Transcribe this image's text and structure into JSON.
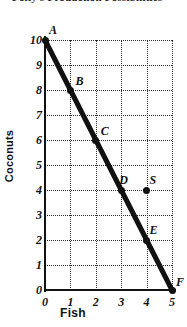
{
  "chart_data": {
    "type": "line",
    "title": "Polly's Production Possibilities",
    "xlabel": "Fish",
    "ylabel": "Coconuts",
    "xlim": [
      0,
      5
    ],
    "ylim": [
      0,
      10
    ],
    "x_ticks": [
      "0",
      "1",
      "2",
      "3",
      "4",
      "5"
    ],
    "y_ticks": [
      "0",
      "1",
      "2",
      "3",
      "4",
      "5",
      "6",
      "7",
      "8",
      "9",
      "10"
    ],
    "grid": "dotted",
    "legend": "none",
    "series": [
      {
        "name": "Production possibilities frontier",
        "type": "line",
        "x": [
          0,
          1,
          2,
          3,
          4,
          5
        ],
        "values": [
          10,
          8,
          6,
          4,
          2,
          0
        ],
        "slope": -2,
        "color": "#111111"
      }
    ],
    "annotations": [
      {
        "label": "A",
        "x": 0,
        "y": 10,
        "on_frontier": true,
        "marker": "dot"
      },
      {
        "label": "B",
        "x": 1,
        "y": 8,
        "on_frontier": true,
        "marker": "dot"
      },
      {
        "label": "C",
        "x": 2,
        "y": 6,
        "on_frontier": true,
        "marker": "dot"
      },
      {
        "label": "D",
        "x": 3,
        "y": 4,
        "on_frontier": true,
        "marker": "dot"
      },
      {
        "label": "E",
        "x": 4,
        "y": 2,
        "on_frontier": true,
        "marker": "dot"
      },
      {
        "label": "F",
        "x": 5,
        "y": 0,
        "on_frontier": true,
        "marker": "dot"
      },
      {
        "label": "S",
        "x": 4,
        "y": 4,
        "on_frontier": false,
        "marker": "dot"
      }
    ]
  },
  "axes": {
    "x_title": "Fish",
    "y_title": "Coconuts"
  },
  "colors": {
    "line": "#111111",
    "grid": "#2b2b2b",
    "axis": "#111111",
    "background": "#ffffff"
  }
}
